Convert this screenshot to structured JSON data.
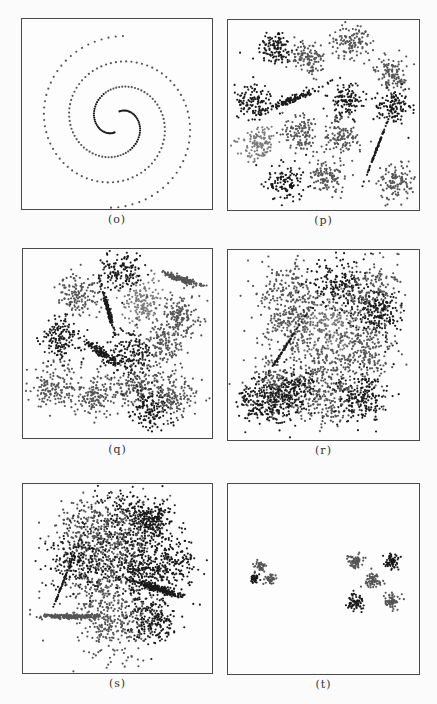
{
  "figure": {
    "panels": [
      {
        "id": "o",
        "caption": "(o)",
        "description": "Two interleaved spiral arms of evenly spaced points"
      },
      {
        "id": "p",
        "caption": "(p)",
        "description": "15 well-separated Gaussian clusters, including one elongated thin cluster"
      },
      {
        "id": "q",
        "caption": "(q)",
        "description": "Overlapping Gaussian clusters with elongated clusters"
      },
      {
        "id": "r",
        "caption": "(r)",
        "description": "Heavily overlapping clusters"
      },
      {
        "id": "s",
        "caption": "(s)",
        "description": "Highly overlapping dense clusters with elongated clusters"
      },
      {
        "id": "t",
        "caption": "(t)",
        "description": "Two groups of small compact clusters: 3 at left, 5 at right"
      }
    ],
    "colors": {
      "dark": "#1a1a1a",
      "mid": "#555555",
      "light": "#7a7a7a",
      "frame": "#4a4a4a"
    }
  },
  "chart_data": [
    {
      "type": "scatter",
      "title": "(o)",
      "pattern": "two-arm spiral",
      "clusters": 2,
      "xlabel": "",
      "ylabel": "",
      "grid": false
    },
    {
      "type": "scatter",
      "title": "(p)",
      "pattern": "separated gaussian blobs",
      "clusters": 15,
      "xlabel": "",
      "ylabel": "",
      "grid": false,
      "centers": [
        [
          0.25,
          0.15
        ],
        [
          0.4,
          0.2
        ],
        [
          0.65,
          0.12
        ],
        [
          0.85,
          0.28
        ],
        [
          0.12,
          0.43
        ],
        [
          0.33,
          0.42
        ],
        [
          0.62,
          0.42
        ],
        [
          0.86,
          0.46
        ],
        [
          0.16,
          0.65
        ],
        [
          0.38,
          0.6
        ],
        [
          0.6,
          0.62
        ],
        [
          0.8,
          0.72
        ],
        [
          0.3,
          0.85
        ],
        [
          0.52,
          0.82
        ],
        [
          0.88,
          0.86
        ]
      ]
    },
    {
      "type": "scatter",
      "title": "(q)",
      "pattern": "moderately overlapping gaussian blobs",
      "clusters": 15,
      "xlabel": "",
      "ylabel": "",
      "grid": false
    },
    {
      "type": "scatter",
      "title": "(r)",
      "pattern": "heavily overlapping gaussian blobs",
      "clusters": 15,
      "xlabel": "",
      "ylabel": "",
      "grid": false
    },
    {
      "type": "scatter",
      "title": "(s)",
      "pattern": "strongly overlapping gaussian blobs",
      "clusters": 15,
      "xlabel": "",
      "ylabel": "",
      "grid": false
    },
    {
      "type": "scatter",
      "title": "(t)",
      "pattern": "small compact clusters in two groups",
      "clusters": 8,
      "xlabel": "",
      "ylabel": "",
      "grid": false,
      "centers": [
        [
          0.14,
          0.5
        ],
        [
          0.17,
          0.43
        ],
        [
          0.22,
          0.5
        ],
        [
          0.67,
          0.41
        ],
        [
          0.86,
          0.41
        ],
        [
          0.76,
          0.51
        ],
        [
          0.66,
          0.62
        ],
        [
          0.86,
          0.62
        ]
      ]
    }
  ]
}
